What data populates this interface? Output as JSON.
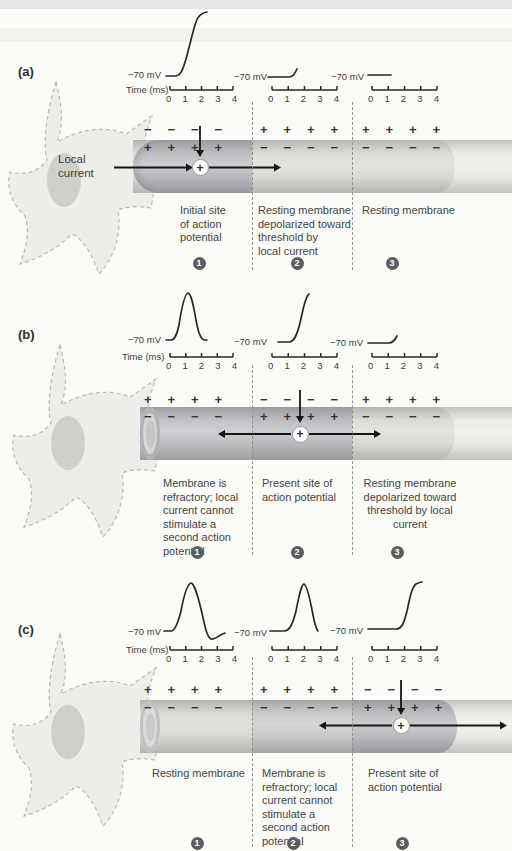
{
  "palette": {
    "axon_active": "#b3b1b7",
    "axon_refractory": "#c3c1bf",
    "axon_resting": "#d7d5ce",
    "axon_tip": "#eae8e2",
    "soma_fill": "#edeeea",
    "nucleus_fill": "#cdd1c9",
    "badge_bg": "#5c5c5e",
    "text": "#454543"
  },
  "shared": {
    "time_axis_label": "Time (ms)",
    "voltage_baseline_label": "−70 mV",
    "tick_labels": [
      "0",
      "1",
      "2",
      "3",
      "4"
    ],
    "current_symbol": "+"
  },
  "panel_a": {
    "letter": "(a)",
    "local_current_label": "Local\ncurrent",
    "current_symbol": "+",
    "traces": [
      "action potential upstroke rising from −70 mV",
      "flat at −70 mV with slight depolarization at end",
      "flat at −70 mV"
    ],
    "regions": [
      {
        "badge": "1",
        "caption": "Initial site\nof action\npotential",
        "charges_top": [
          "−",
          "−",
          "−",
          "−"
        ],
        "charges_bottom": [
          "+",
          "+",
          "+",
          "+"
        ]
      },
      {
        "badge": "2",
        "caption": "Resting membrane\ndepolarized toward\nthreshold by\nlocal current",
        "charges_top": [
          "+",
          "+",
          "+",
          "+"
        ],
        "charges_bottom": [
          "−",
          "−",
          "−",
          "−"
        ]
      },
      {
        "badge": "3",
        "caption": "Resting membrane",
        "charges_top": [
          "+",
          "+",
          "+",
          "+"
        ],
        "charges_bottom": [
          "−",
          "−",
          "−",
          "−"
        ]
      }
    ]
  },
  "panel_b": {
    "letter": "(b)",
    "current_symbol": "+",
    "traces": [
      "complete action potential spike peaking near 1.5 ms",
      "action potential upstroke near 2 ms",
      "flat at −70 mV with slight depolarization at end"
    ],
    "regions": [
      {
        "badge": "1",
        "caption": "Membrane is\nrefractory; local\ncurrent cannot\nstimulate a\nsecond action\npotential",
        "charges_top": [
          "+",
          "+",
          "+",
          "+"
        ],
        "charges_bottom": [
          "−",
          "−",
          "−",
          "−"
        ]
      },
      {
        "badge": "2",
        "caption": "Present site of\naction potential",
        "charges_top": [
          "−",
          "−",
          "−",
          "−"
        ],
        "charges_bottom": [
          "+",
          "+",
          "+",
          "+"
        ]
      },
      {
        "badge": "3",
        "caption": "Resting membrane\ndepolarized toward\nthreshold by local\ncurrent",
        "charges_top": [
          "+",
          "+",
          "+",
          "+"
        ],
        "charges_bottom": [
          "−",
          "−",
          "−",
          "−"
        ]
      }
    ]
  },
  "panel_c": {
    "letter": "(c)",
    "current_symbol": "+",
    "traces": [
      "complete action potential with undershoot, peak near 1.5 ms",
      "complete action potential spike peaking near 2.5 ms",
      "action potential upstroke near 2.5 ms"
    ],
    "regions": [
      {
        "badge": "1",
        "caption": "Resting membrane",
        "charges_top": [
          "+",
          "+",
          "+",
          "+"
        ],
        "charges_bottom": [
          "−",
          "−",
          "−",
          "−"
        ]
      },
      {
        "badge": "2",
        "caption": "Membrane is\nrefractory; local\ncurrent cannot\nstimulate a\nsecond action\npotential",
        "charges_top": [
          "+",
          "+",
          "+",
          "+"
        ],
        "charges_bottom": [
          "−",
          "−",
          "−",
          "−"
        ]
      },
      {
        "badge": "3",
        "caption": "Present site of\naction potential",
        "charges_top": [
          "−",
          "−",
          "−",
          "−"
        ],
        "charges_bottom": [
          "+",
          "+",
          "+",
          "+"
        ]
      }
    ]
  }
}
